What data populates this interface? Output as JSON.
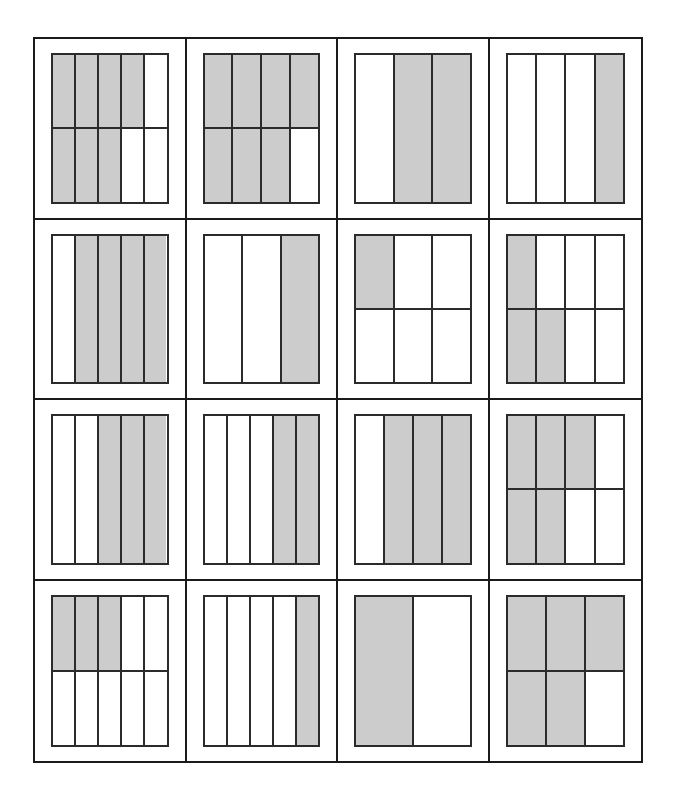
{
  "page": {
    "width": 676,
    "height": 798
  },
  "colors": {
    "shaded_fill": "#cccccc",
    "unshaded_fill": "#ffffff",
    "part_stroke": "#2b2b2b",
    "frame_stroke": "#1a1a1a",
    "page_background": "#ffffff"
  },
  "layout": {
    "grid_columns": 4,
    "grid_rows": 4,
    "total_cells": 16
  },
  "cells": [
    {
      "index": 1,
      "name": "fraction-model-1",
      "columns": 5,
      "rows": 2,
      "total_parts": 10,
      "shaded_parts": 7,
      "fraction": "7/10",
      "grid": [
        [
          true,
          true,
          true,
          true,
          false
        ],
        [
          true,
          true,
          true,
          false,
          false
        ]
      ]
    },
    {
      "index": 2,
      "name": "fraction-model-2",
      "columns": 4,
      "rows": 2,
      "total_parts": 8,
      "shaded_parts": 7,
      "fraction": "7/8",
      "grid": [
        [
          true,
          true,
          true,
          true
        ],
        [
          true,
          true,
          true,
          false
        ]
      ]
    },
    {
      "index": 3,
      "name": "fraction-model-3",
      "columns": 3,
      "rows": 1,
      "total_parts": 3,
      "shaded_parts": 2,
      "fraction": "2/3",
      "grid": [
        [
          false,
          true,
          true
        ]
      ]
    },
    {
      "index": 4,
      "name": "fraction-model-4",
      "columns": 4,
      "rows": 1,
      "total_parts": 4,
      "shaded_parts": 1,
      "fraction": "1/4",
      "grid": [
        [
          false,
          false,
          false,
          true
        ]
      ]
    },
    {
      "index": 5,
      "name": "fraction-model-5",
      "columns": 5,
      "rows": 1,
      "total_parts": 5,
      "shaded_parts": 4,
      "fraction": "4/5",
      "grid": [
        [
          false,
          true,
          true,
          true,
          true
        ]
      ]
    },
    {
      "index": 6,
      "name": "fraction-model-6",
      "columns": 3,
      "rows": 1,
      "total_parts": 3,
      "shaded_parts": 1,
      "fraction": "1/3",
      "grid": [
        [
          false,
          false,
          true
        ]
      ]
    },
    {
      "index": 7,
      "name": "fraction-model-7",
      "columns": 3,
      "rows": 2,
      "total_parts": 6,
      "shaded_parts": 1,
      "fraction": "1/6",
      "grid": [
        [
          true,
          false,
          false
        ],
        [
          false,
          false,
          false
        ]
      ]
    },
    {
      "index": 8,
      "name": "fraction-model-8",
      "columns": 4,
      "rows": 2,
      "total_parts": 8,
      "shaded_parts": 3,
      "fraction": "3/8",
      "grid": [
        [
          true,
          false,
          false,
          false
        ],
        [
          true,
          true,
          false,
          false
        ]
      ]
    },
    {
      "index": 9,
      "name": "fraction-model-9",
      "columns": 5,
      "rows": 1,
      "total_parts": 5,
      "shaded_parts": 3,
      "fraction": "3/5",
      "grid": [
        [
          false,
          false,
          true,
          true,
          true
        ]
      ]
    },
    {
      "index": 10,
      "name": "fraction-model-10",
      "columns": 5,
      "rows": 1,
      "total_parts": 5,
      "shaded_parts": 2,
      "fraction": "2/5",
      "grid": [
        [
          false,
          false,
          false,
          true,
          true
        ]
      ]
    },
    {
      "index": 11,
      "name": "fraction-model-11",
      "columns": 4,
      "rows": 1,
      "total_parts": 4,
      "shaded_parts": 3,
      "fraction": "3/4",
      "grid": [
        [
          false,
          true,
          true,
          true
        ]
      ]
    },
    {
      "index": 12,
      "name": "fraction-model-12",
      "columns": 4,
      "rows": 2,
      "total_parts": 8,
      "shaded_parts": 5,
      "fraction": "5/8",
      "grid": [
        [
          true,
          true,
          true,
          false
        ],
        [
          true,
          true,
          false,
          false
        ]
      ]
    },
    {
      "index": 13,
      "name": "fraction-model-13",
      "columns": 5,
      "rows": 2,
      "total_parts": 10,
      "shaded_parts": 3,
      "fraction": "3/10",
      "grid": [
        [
          true,
          true,
          true,
          false,
          false
        ],
        [
          false,
          false,
          false,
          false,
          false
        ]
      ]
    },
    {
      "index": 14,
      "name": "fraction-model-14",
      "columns": 5,
      "rows": 1,
      "total_parts": 5,
      "shaded_parts": 1,
      "fraction": "1/5",
      "grid": [
        [
          false,
          false,
          false,
          false,
          true
        ]
      ]
    },
    {
      "index": 15,
      "name": "fraction-model-15",
      "columns": 2,
      "rows": 1,
      "total_parts": 2,
      "shaded_parts": 1,
      "fraction": "1/2",
      "grid": [
        [
          true,
          false
        ]
      ]
    },
    {
      "index": 16,
      "name": "fraction-model-16",
      "columns": 3,
      "rows": 2,
      "total_parts": 6,
      "shaded_parts": 5,
      "fraction": "5/6",
      "grid": [
        [
          true,
          true,
          true
        ],
        [
          true,
          true,
          false
        ]
      ]
    }
  ]
}
